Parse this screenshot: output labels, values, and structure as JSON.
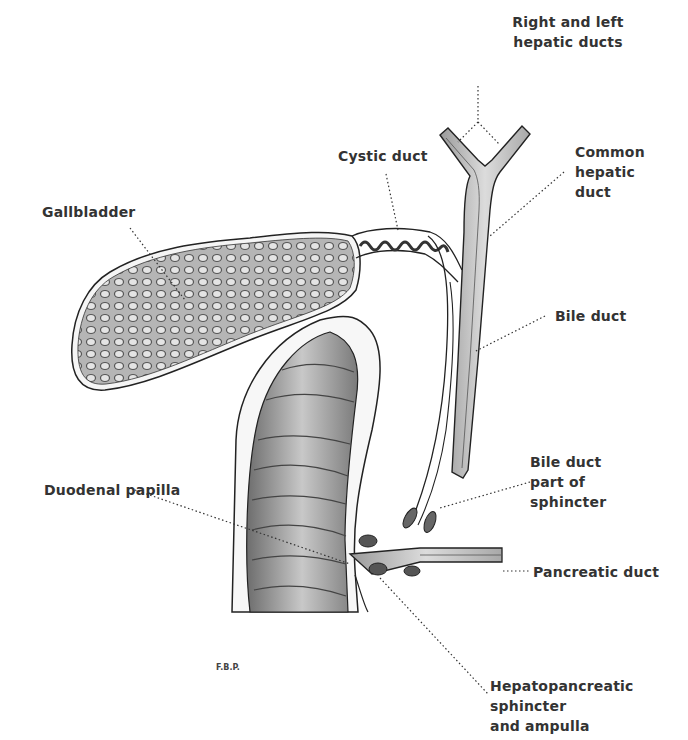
{
  "figure": {
    "signature": "F.B.P.",
    "labels": {
      "right_left_hepatic": [
        "Right and left",
        "hepatic ducts"
      ],
      "cystic_duct": "Cystic duct",
      "common_hepatic": [
        "Common",
        "hepatic",
        "duct"
      ],
      "gallbladder": "Gallbladder",
      "bile_duct": "Bile duct",
      "bile_duct_sphincter": [
        "Bile duct",
        "part of",
        "sphincter"
      ],
      "duodenal_papilla": "Duodenal papilla",
      "pancreatic_duct": "Pancreatic duct",
      "hepatopancreatic": [
        "Hepatopancreatic",
        "sphincter",
        "and ampulla"
      ]
    },
    "colors": {
      "background": "#ffffff",
      "ink": "#2b2b2b",
      "gallbladder_fill": "#8a8a8a",
      "duct_fill": "#c9c9c9",
      "duodenum_fill": "#9a9a9a"
    }
  }
}
